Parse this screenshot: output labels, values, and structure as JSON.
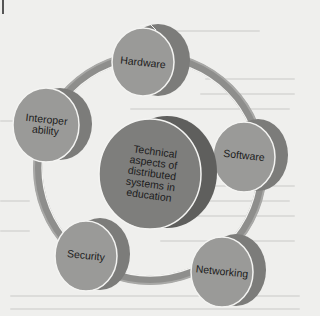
{
  "diagram": {
    "title": "",
    "center": {
      "label_lines": [
        "Technical",
        "aspects of",
        "distributed",
        "systems in",
        "education"
      ]
    },
    "nodes": [
      {
        "id": "hardware",
        "label_lines": [
          "Hardware"
        ]
      },
      {
        "id": "software",
        "label_lines": [
          "Software"
        ]
      },
      {
        "id": "networking",
        "label_lines": [
          "Networking"
        ]
      },
      {
        "id": "security",
        "label_lines": [
          "Security"
        ]
      },
      {
        "id": "interoperability",
        "label_lines": [
          "Interoper",
          "ability"
        ]
      }
    ],
    "colors": {
      "face": "#9a9a98",
      "side": "#7c7c7a",
      "center_face": "#7e7e7c",
      "center_side": "#5f5f5d",
      "ring": "#9c9c9a",
      "outline": "#f4f4f2",
      "background": "#efefed"
    }
  }
}
